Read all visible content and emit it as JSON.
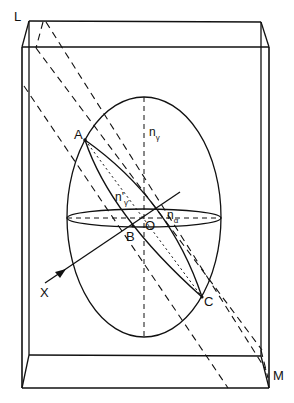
{
  "figure": {
    "type": "optical-indicatrix-diagram",
    "stroke_color": "#111111",
    "background": "#ffffff"
  },
  "labels": {
    "L": "L",
    "M": "M",
    "A": "A",
    "B": "B",
    "C": "C",
    "O": "O",
    "X": "X",
    "n_gamma": {
      "base": "n",
      "sub": "γ"
    },
    "n_gamma_prime": {
      "base": "n'",
      "sub": "γ'"
    },
    "n_alpha": {
      "base": "n",
      "sub": "α"
    }
  }
}
